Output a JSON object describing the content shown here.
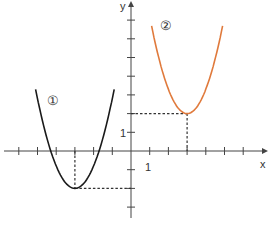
{
  "chart_data": {
    "type": "line",
    "title": "",
    "xlabel": "x",
    "ylabel": "y",
    "xlim": [
      -7,
      7
    ],
    "ylim": [
      -4,
      7.5
    ],
    "grid": false,
    "tick_labels": {
      "x": [
        "1"
      ],
      "y": [
        "1"
      ]
    },
    "series": [
      {
        "name": "①",
        "color": "#1a1a1a",
        "formula": "y = 1.2(x+3)^2 - 2",
        "vertex": [
          -3,
          -2
        ],
        "x_range": [
          -5.1,
          -0.9
        ]
      },
      {
        "name": "②",
        "color": "#e07a3c",
        "formula": "y = 1.3(x-3)^2 + 2",
        "vertex": [
          3,
          2
        ],
        "x_range": [
          1.1,
          4.9
        ]
      }
    ],
    "annotations": [
      {
        "type": "dashed",
        "from": [
          -3,
          0
        ],
        "to": [
          -3,
          -2
        ]
      },
      {
        "type": "dashed",
        "from": [
          -3,
          -2
        ],
        "to": [
          0,
          -2
        ]
      },
      {
        "type": "dashed",
        "from": [
          0,
          2
        ],
        "to": [
          3,
          2
        ]
      },
      {
        "type": "dashed",
        "from": [
          3,
          2
        ],
        "to": [
          3,
          0
        ]
      }
    ]
  },
  "labels": {
    "x_axis": "x",
    "y_axis": "y",
    "x_tick": "1",
    "y_tick": "1",
    "curve1": "①",
    "curve2": "②"
  }
}
